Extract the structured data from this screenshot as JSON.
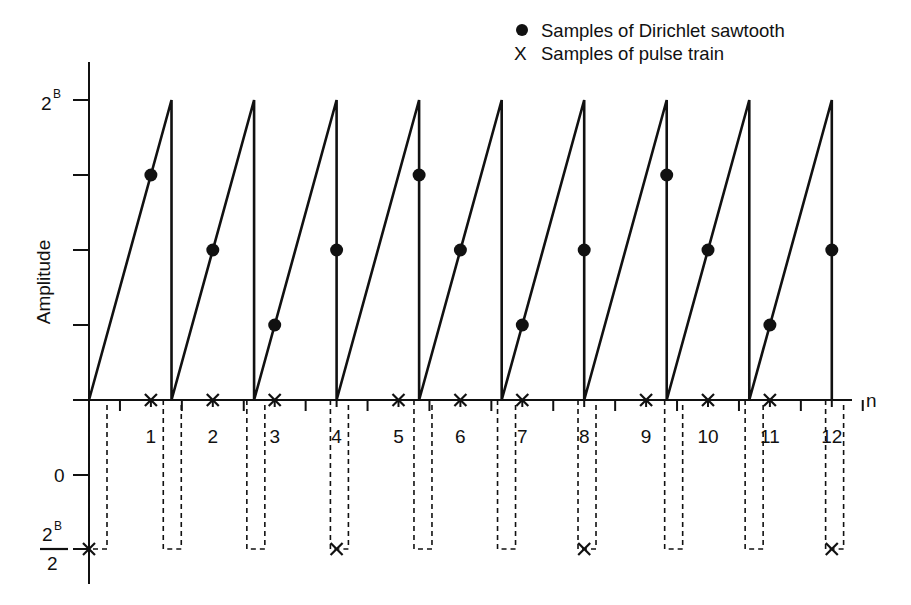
{
  "legend": {
    "items": [
      {
        "marker": "filled-circle",
        "label": "Samples of Dirichlet sawtooth"
      },
      {
        "marker": "x-mark",
        "label": "Samples of pulse train"
      }
    ]
  },
  "axes": {
    "y_label": "Amplitude",
    "x_label": "n",
    "upper_y_ticks": [
      {
        "label": "2^B",
        "value_frac": 1.0
      },
      {
        "label": "",
        "value_frac": 0.75
      },
      {
        "label": "",
        "value_frac": 0.5
      },
      {
        "label": "",
        "value_frac": 0.25
      }
    ],
    "upper_y_tick_label": {
      "base": "2",
      "sup": "B"
    },
    "lower_y_ticks": [
      {
        "label": "0"
      },
      {
        "label": "-2^B/2"
      }
    ],
    "lower_y_fraction": {
      "num_base": "2",
      "num_sup": "B",
      "den": "2"
    },
    "x_tick_labels": [
      "1",
      "2",
      "3",
      "4",
      "5",
      "6",
      "7",
      "8",
      "9",
      "10",
      "11",
      "12"
    ]
  },
  "chart_data": {
    "type": "line",
    "title": "",
    "xlabel": "n",
    "ylabel": "Amplitude",
    "legend": [
      "Samples of Dirichlet sawtooth",
      "Samples of pulse train"
    ],
    "legend_position": "top-right",
    "grid": false,
    "x": [
      0,
      1,
      2,
      3,
      4,
      5,
      6,
      7,
      8,
      9,
      10,
      11,
      12
    ],
    "sawtooth": {
      "description": "Continuous sawtooth ramping 0 to 2^B with period 4/3 samples, vertical drop back to 0",
      "period_samples": 1.3333,
      "peak_n": [
        1.333,
        2.667,
        4.0,
        5.333,
        6.667,
        8.0,
        9.333,
        10.667,
        12.0
      ],
      "amplitude_max": "2^B"
    },
    "series": [
      {
        "name": "Samples of Dirichlet sawtooth",
        "n": [
          1,
          2,
          3,
          4,
          5,
          6,
          7,
          8,
          9,
          10,
          11,
          12
        ],
        "values_frac_of_2B": [
          0.75,
          0.5,
          0.25,
          0.5,
          0.75,
          0.5,
          0.25,
          0.5,
          0.75,
          0.5,
          0.25,
          0.5
        ]
      },
      {
        "name": "Samples of pulse train",
        "n": [
          0,
          1,
          2,
          3,
          4,
          5,
          6,
          7,
          8,
          9,
          10,
          11,
          12
        ],
        "values": [
          "-2^B/2",
          "0",
          "0",
          "0",
          "-2^B/2",
          "0",
          "0",
          "0",
          "-2^B/2",
          "0",
          "0",
          "0",
          "-2^B/2"
        ]
      }
    ],
    "pulse_train_rectangles_start_n": [
      0,
      1.2,
      2.55,
      3.9,
      5.25,
      6.6,
      7.9,
      9.3,
      10.6,
      11.9
    ],
    "upper_ylim": [
      0,
      "2^B"
    ],
    "lower_ylim": [
      "-2^B/2",
      0
    ]
  }
}
